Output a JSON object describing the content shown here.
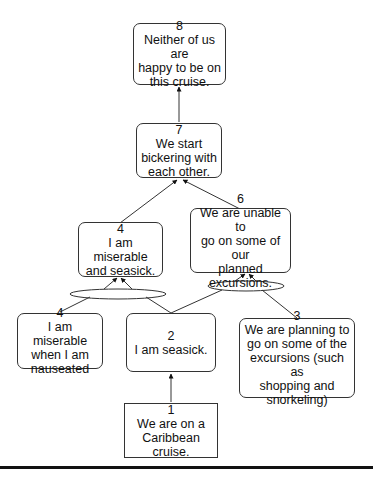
{
  "diagram": {
    "type": "argument-map",
    "nodes": [
      {
        "id": "8",
        "number": "8",
        "text": "Neither of us are happy to be on this cruise.",
        "shape": "rounded"
      },
      {
        "id": "7",
        "number": "7",
        "text": "We start bickering with each other.",
        "shape": "rounded"
      },
      {
        "id": "4a",
        "number": "4",
        "text": "I am miserable and seasick.",
        "shape": "rounded"
      },
      {
        "id": "6",
        "number": "6",
        "text": "We are unable to go on some of our planned excursions.",
        "shape": "rounded"
      },
      {
        "id": "4b",
        "number": "4",
        "text": "I am miserable when I am nauseated",
        "shape": "rounded"
      },
      {
        "id": "2",
        "number": "2",
        "text": "I am seasick.",
        "shape": "rounded"
      },
      {
        "id": "3",
        "number": "3",
        "text": "We are planning to go on some of the excursions (such as shopping and snorkeling)",
        "shape": "rounded"
      },
      {
        "id": "1",
        "number": "1",
        "text": "We are on a Caribbean cruise.",
        "shape": "square"
      }
    ],
    "edges": [
      {
        "from": "7",
        "to": "8"
      },
      {
        "from": "4a",
        "to": "7"
      },
      {
        "from": "6",
        "to": "7"
      },
      {
        "from": [
          "4b",
          "2"
        ],
        "to": "4a",
        "joint": true
      },
      {
        "from": [
          "2",
          "3"
        ],
        "to": "6",
        "joint": true
      },
      {
        "from": "1",
        "to": "2"
      }
    ]
  },
  "labels": {
    "n8": {
      "num": "8",
      "l1": "Neither of us are",
      "l2": "happy to be on",
      "l3": "this cruise."
    },
    "n7": {
      "num": "7",
      "l1": "We start",
      "l2": "bickering with",
      "l3": "each other."
    },
    "n4a": {
      "num": "4",
      "l1": "I am miserable",
      "l2": "and seasick."
    },
    "n6": {
      "num": "6",
      "l1": "We are unable to",
      "l2": "go on some of our",
      "l3": "planned",
      "l4": "excursions."
    },
    "n4b": {
      "num": "4",
      "l1": "I am miserable",
      "l2": "when I am",
      "l3": "nauseated"
    },
    "n2": {
      "num": "2",
      "l1": "I am seasick."
    },
    "n3": {
      "num": "3",
      "l1": "We are planning to",
      "l2": "go on some of the",
      "l3": "excursions (such as",
      "l4": "shopping and",
      "l5": "snorkeling)"
    },
    "n1": {
      "num": "1",
      "l1": "We are on a",
      "l2": "Caribbean",
      "l3": "cruise."
    }
  }
}
